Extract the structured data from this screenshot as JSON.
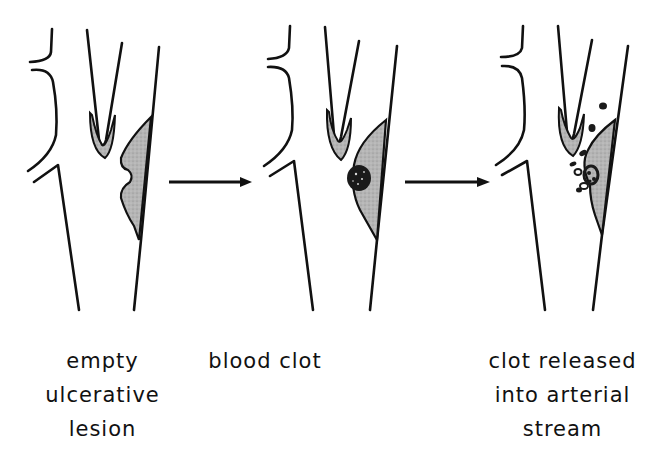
{
  "diagram": {
    "stroke_color": "#111111",
    "plaque_fill": "#b8b8b8",
    "clot_fill": "#1a1a1a",
    "panels": [
      {
        "id": "panel-1",
        "label_lines": [
          "empty",
          "ulcerative",
          "lesion"
        ]
      },
      {
        "id": "panel-2",
        "label_lines": [
          "blood clot"
        ]
      },
      {
        "id": "panel-3",
        "label_lines": [
          "clot released",
          "into arterial",
          "stream"
        ]
      }
    ],
    "arrows": [
      {
        "from": "panel-1",
        "to": "panel-2"
      },
      {
        "from": "panel-2",
        "to": "panel-3"
      }
    ]
  }
}
